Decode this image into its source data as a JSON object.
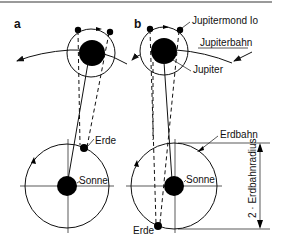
{
  "diagram": {
    "panels": [
      {
        "label": "a"
      },
      {
        "label": "b"
      }
    ],
    "labels": {
      "io": "Jupitermond Io",
      "jupiter_orbit": "Jupiterbahn",
      "jupiter": "Jupiter",
      "earth_a": "Erde",
      "sun_a": "Sonne",
      "earth_orbit": "Erdbahn",
      "sun_b": "Sonne",
      "earth_b": "Erde",
      "dimension": "2 · Erdbahnradius"
    },
    "colors": {
      "line": "#111111",
      "fill": "#000000",
      "border": "#9a9a9a",
      "background": "#ffffff"
    }
  }
}
